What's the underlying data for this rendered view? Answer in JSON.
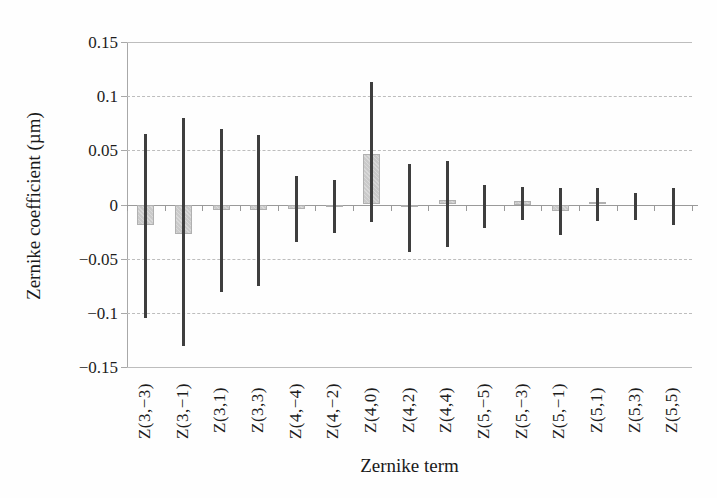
{
  "figure": {
    "x_axis_title": "Zernike term",
    "y_axis_title": "Zernike coefficient (µm)"
  },
  "colors": {
    "background": "#fefefe",
    "bar_fill": "#cacaca",
    "bar_border": "#b0b0b0",
    "error_bar": "#3e3e3e",
    "gridline": "#bdbdbd",
    "axis_line": "#9a9a9a",
    "text": "#1c1c1c"
  },
  "chart_data": {
    "type": "bar",
    "title": "",
    "xlabel": "Zernike term",
    "ylabel": "Zernike coefficient (µm)",
    "ylim": [
      -0.15,
      0.15
    ],
    "grid": true,
    "legend": false,
    "categories": [
      "Z(3,−3)",
      "Z(3,−1)",
      "Z(3,1)",
      "Z(3,3)",
      "Z(4,−4)",
      "Z(4,−2)",
      "Z(4,0)",
      "Z(4,2)",
      "Z(4,4)",
      "Z(5,−5)",
      "Z(5,−3)",
      "Z(5,−1)",
      "Z(5,1)",
      "Z(5,3)",
      "Z(5,5)"
    ],
    "values": [
      -0.019,
      -0.027,
      -0.005,
      -0.005,
      -0.004,
      -0.002,
      0.047,
      -0.002,
      0.004,
      0.0,
      0.003,
      -0.006,
      0.002,
      0.0,
      0.0
    ],
    "error_low": [
      -0.105,
      -0.131,
      -0.081,
      -0.075,
      -0.035,
      -0.026,
      -0.016,
      -0.044,
      -0.039,
      -0.022,
      -0.014,
      -0.028,
      -0.015,
      -0.014,
      -0.019
    ],
    "error_high": [
      0.065,
      0.08,
      0.07,
      0.064,
      0.026,
      0.023,
      0.113,
      0.037,
      0.04,
      0.018,
      0.016,
      0.015,
      0.015,
      0.011,
      0.015
    ],
    "yticks": [
      {
        "label": "0.15",
        "value": 0.15
      },
      {
        "label": "0.1",
        "value": 0.1
      },
      {
        "label": "0.05",
        "value": 0.05
      },
      {
        "label": "0",
        "value": 0.0
      },
      {
        "label": "−0.05",
        "value": -0.05
      },
      {
        "label": "−0.1",
        "value": -0.1
      },
      {
        "label": "−0.15",
        "value": -0.15
      }
    ]
  }
}
